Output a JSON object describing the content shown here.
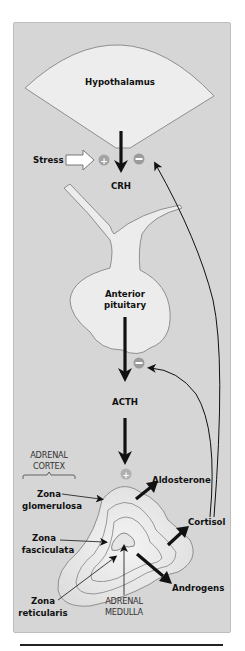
{
  "diagram": {
    "labels": {
      "hypothalamus": "Hypothalamus",
      "stress": "Stress",
      "crh": "CRH",
      "anterior_pituitary_line1": "Anterior",
      "anterior_pituitary_line2": "pituitary",
      "acth": "ACTH",
      "adrenal_cortex_line1": "ADRENAL",
      "adrenal_cortex_line2": "CORTEX",
      "zona_glomerulosa_line1": "Zona",
      "zona_glomerulosa_line2": "glomerulosa",
      "zona_fasciculata_line1": "Zona",
      "zona_fasciculata_line2": "fasciculata",
      "zona_reticularis_line1": "Zona",
      "zona_reticularis_line2": "reticularis",
      "adrenal_medulla_line1": "ADRENAL",
      "adrenal_medulla_line2": "MEDULLA",
      "aldosterone": "Aldosterone",
      "cortisol": "Cortisol",
      "androgens": "Androgens"
    },
    "signs": {
      "stress_plus": "+",
      "crh_minus": "−",
      "acth_minus": "−",
      "adrenal_plus": "+"
    },
    "colors": {
      "panel_bg": "#d6d6d6",
      "shape_fill": "#ececec",
      "shape_stroke": "#8c8c8c",
      "sign_fill": "#9b9b9b",
      "arrow": "#111111"
    }
  }
}
